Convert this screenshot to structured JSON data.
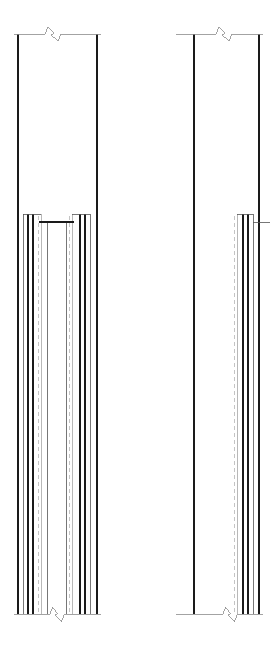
{
  "document": {
    "kind": "cad-elevation-detail",
    "title": "",
    "canvas": {
      "width": 277,
      "height": 649,
      "background": "#ffffff"
    }
  },
  "style": {
    "object_line_color": "#1a1a1a",
    "thin_line_color": "#555555",
    "light_line_color": "#9a9a9a",
    "hidden_line_color": "#b5b5b5",
    "break_line_color": "#8c8c8c",
    "object_line_width": 1.1,
    "thin_line_width": 0.8,
    "light_line_width": 0.7,
    "hidden_line_width": 0.8,
    "hidden_dash": "4,3"
  },
  "views": [
    {
      "id": "left-view",
      "name": "left-elevation-detail",
      "label": "",
      "extent": {
        "x_left": 16,
        "x_right": 99,
        "y_top": 34,
        "y_bottom": 614
      },
      "break_top": {
        "y": 34,
        "x_start": 16,
        "x_end": 99,
        "zig_center": 53,
        "zig_width": 16,
        "zig_height": 14
      },
      "break_bottom": {
        "y": 614,
        "x_start": 16,
        "x_end": 99,
        "zig_center": 57,
        "zig_width": 15,
        "zig_height": 15
      },
      "outer_lines": [
        {
          "name": "outer-left-edge",
          "x": 18,
          "y1": 34,
          "y2": 614,
          "weight": "object"
        },
        {
          "name": "outer-right-edge",
          "x": 97,
          "y1": 34,
          "y2": 614,
          "weight": "object"
        }
      ],
      "shoulder_y": 214,
      "sill_y": 222,
      "cross_members": [
        {
          "name": "left-shoulder-cap",
          "x1": 23,
          "x2": 41,
          "y": 214,
          "weight": "thin"
        },
        {
          "name": "right-shoulder-cap",
          "x1": 72,
          "x2": 90,
          "y": 214,
          "weight": "thin"
        },
        {
          "name": "inner-sill-beam",
          "x1": 39,
          "x2": 74,
          "y": 222,
          "weight": "object"
        }
      ],
      "vertical_lines": [
        {
          "name": "layer-line-1",
          "x": 23,
          "y1": 214,
          "y2": 614,
          "weight": "thin"
        },
        {
          "name": "layer-line-2",
          "x": 28,
          "y1": 214,
          "y2": 614,
          "weight": "object"
        },
        {
          "name": "layer-line-3",
          "x": 33,
          "y1": 214,
          "y2": 614,
          "weight": "object"
        },
        {
          "name": "layer-line-4",
          "x": 41,
          "y1": 214,
          "y2": 614,
          "weight": "light"
        },
        {
          "name": "layer-line-5",
          "x": 47,
          "y1": 222,
          "y2": 614,
          "weight": "thin"
        },
        {
          "name": "layer-line-6",
          "x": 66,
          "y1": 222,
          "y2": 614,
          "weight": "thin"
        },
        {
          "name": "layer-line-7",
          "x": 72,
          "y1": 214,
          "y2": 614,
          "weight": "light"
        },
        {
          "name": "layer-line-8",
          "x": 80,
          "y1": 214,
          "y2": 614,
          "weight": "object"
        },
        {
          "name": "layer-line-9",
          "x": 85,
          "y1": 214,
          "y2": 614,
          "weight": "object"
        },
        {
          "name": "layer-line-10",
          "x": 90,
          "y1": 214,
          "y2": 614,
          "weight": "thin"
        }
      ],
      "hidden_lines": [
        {
          "name": "hidden-centerline-left",
          "x": 38,
          "y1": 216,
          "y2": 614
        },
        {
          "name": "hidden-centerline-right",
          "x": 69,
          "y1": 216,
          "y2": 614
        }
      ]
    },
    {
      "id": "right-view",
      "name": "right-elevation-detail",
      "label": "",
      "extent": {
        "x_left": 178,
        "x_right": 261,
        "y_top": 34,
        "y_bottom": 614
      },
      "break_top": {
        "y": 34,
        "x_start": 178,
        "x_end": 261,
        "zig_center": 224,
        "zig_width": 16,
        "zig_height": 14
      },
      "break_bottom": {
        "y": 614,
        "x_start": 178,
        "x_end": 261,
        "zig_center": 230,
        "zig_width": 15,
        "zig_height": 15
      },
      "outer_lines": [
        {
          "name": "outer-left-edge",
          "x": 194,
          "y1": 34,
          "y2": 614,
          "weight": "object"
        },
        {
          "name": "outer-right-edge",
          "x": 259,
          "y1": 34,
          "y2": 614,
          "weight": "object"
        }
      ],
      "shoulder_y": 214,
      "sill_y": 222,
      "cross_members": [
        {
          "name": "shoulder-cap",
          "x1": 237,
          "x2": 253,
          "y": 214,
          "weight": "thin"
        },
        {
          "name": "offset-step",
          "x1": 253,
          "x2": 270,
          "y": 222,
          "weight": "thin"
        }
      ],
      "vertical_lines": [
        {
          "name": "layer-line-1",
          "x": 237,
          "y1": 214,
          "y2": 614,
          "weight": "light"
        },
        {
          "name": "layer-line-2",
          "x": 243,
          "y1": 214,
          "y2": 614,
          "weight": "object"
        },
        {
          "name": "layer-line-3",
          "x": 248,
          "y1": 214,
          "y2": 614,
          "weight": "object"
        },
        {
          "name": "layer-line-4",
          "x": 253,
          "y1": 214,
          "y2": 614,
          "weight": "thin"
        }
      ],
      "hidden_lines": [
        {
          "name": "hidden-centerline",
          "x": 234,
          "y1": 216,
          "y2": 614
        }
      ]
    }
  ]
}
